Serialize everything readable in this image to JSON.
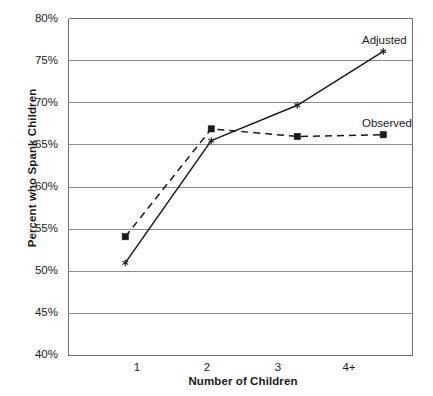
{
  "chart_data": {
    "type": "line",
    "title": "",
    "xlabel": "Number of Children",
    "ylabel": "Percent who Spank Children",
    "categories": [
      "1",
      "2",
      "3",
      "4+"
    ],
    "ylim": [
      40,
      80
    ],
    "ytick_labels": [
      "40%",
      "45%",
      "50%",
      "55%",
      "60%",
      "65%",
      "70%",
      "75%",
      "80%"
    ],
    "ytick_values": [
      40,
      45,
      50,
      55,
      60,
      65,
      70,
      75,
      80
    ],
    "grid": true,
    "legend_position": "right-inline",
    "series": [
      {
        "name": "Adjusted",
        "values": [
          51.0,
          65.5,
          69.7,
          76.1
        ],
        "line_style": "solid",
        "marker": "asterisk",
        "color": "#1a1a1a"
      },
      {
        "name": "Observed",
        "values": [
          54.1,
          66.9,
          66.0,
          66.2
        ],
        "line_style": "dashed",
        "marker": "square",
        "color": "#1a1a1a"
      }
    ]
  },
  "axis": {
    "y_title": "Percent who Spank Children",
    "x_title": "Number of Children",
    "y_ticks": [
      "80%",
      "75%",
      "70%",
      "65%",
      "60%",
      "55%",
      "50%",
      "45%",
      "40%"
    ],
    "x_ticks": [
      "1",
      "2",
      "3",
      "4+"
    ]
  },
  "labels": {
    "adjusted": "Adjusted",
    "observed": "Observed"
  },
  "colors": {
    "line": "#1a1a1a",
    "grid": "#8c8c8c",
    "axis": "#6e6e6e",
    "background": "#ffffff"
  }
}
